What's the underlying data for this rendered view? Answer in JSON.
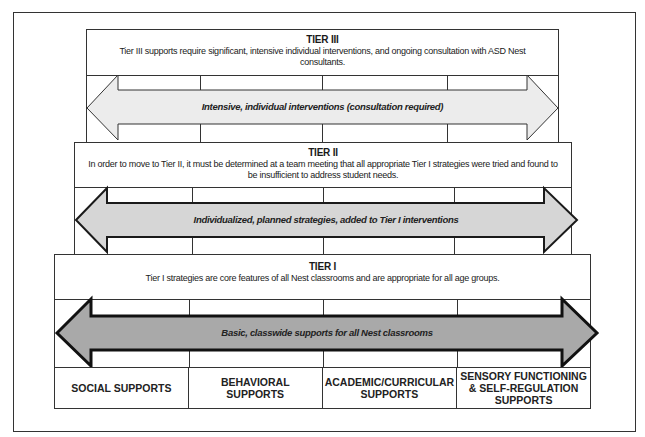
{
  "tiers": [
    {
      "id": "tier3",
      "title": "TIER III",
      "description": "Tier III supports require significant, intensive individual interventions, and ongoing consultation with ASD Nest consultants.",
      "arrow_label": "Intensive, individual interventions (consultation required)",
      "arrow_fill": "#ececec",
      "arrow_stroke_width": 1
    },
    {
      "id": "tier2",
      "title": "TIER II",
      "description": "In order to move to Tier II, it must be determined at a team meeting that all appropriate Tier I strategies were tried and found to be insufficient to address student needs.",
      "arrow_label": "Individualized, planned strategies, added to Tier I interventions",
      "arrow_fill": "#d6d6d6",
      "arrow_stroke_width": 2
    },
    {
      "id": "tier1",
      "title": "TIER I",
      "description": "Tier I strategies are core features of all Nest classrooms and are appropriate for all age groups.",
      "arrow_label": "Basic, classwide supports for all Nest classrooms",
      "arrow_fill": "#a9a9a9",
      "arrow_stroke_width": 3
    }
  ],
  "support_categories": [
    "SOCIAL SUPPORTS",
    "BEHAVIORAL SUPPORTS",
    "ACADEMIC/CURRICULAR SUPPORTS",
    "SENSORY FUNCTIONING & SELF-REGULATION SUPPORTS"
  ]
}
